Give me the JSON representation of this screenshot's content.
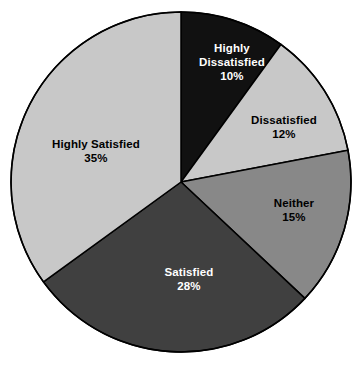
{
  "chart_data": {
    "type": "pie",
    "title": "",
    "subtitle": "",
    "xlabel": "",
    "ylabel": "",
    "grid": false,
    "legend_position": "none",
    "labels_inside_slices": true,
    "start_angle_deg": 0,
    "direction": "clockwise",
    "categories": [
      "Highly Dissatisfied",
      "Dissatisfied",
      "Neither",
      "Satisfied",
      "Highly Satisfied"
    ],
    "values": [
      10,
      12,
      15,
      28,
      35
    ],
    "value_unit": "%",
    "slices": [
      {
        "label": "Highly Dissatisfied",
        "value": 10,
        "value_text": "10%",
        "color": "#111111",
        "text_color": "#ffffff",
        "start_deg": 0,
        "end_deg": 36,
        "label_x": 232,
        "label_y": 62
      },
      {
        "label": "Dissatisfied",
        "value": 12,
        "value_text": "12%",
        "color": "#c8c8c8",
        "text_color": "#000000",
        "start_deg": 36,
        "end_deg": 79.2,
        "label_x": 284,
        "label_y": 127
      },
      {
        "label": "Neither",
        "value": 15,
        "value_text": "15%",
        "color": "#888888",
        "text_color": "#000000",
        "start_deg": 79.2,
        "end_deg": 133.2,
        "label_x": 294,
        "label_y": 210
      },
      {
        "label": "Satisfied",
        "value": 28,
        "value_text": "28%",
        "color": "#404040",
        "text_color": "#ffffff",
        "start_deg": 133.2,
        "end_deg": 234,
        "label_x": 189,
        "label_y": 279
      },
      {
        "label": "Highly Satisfied",
        "value": 35,
        "value_text": "35%",
        "color": "#c8c8c8",
        "text_color": "#000000",
        "start_deg": 234,
        "end_deg": 360,
        "label_x": 96,
        "label_y": 151
      }
    ],
    "geometry": {
      "center_x": 181,
      "center_y": 182,
      "radius": 170,
      "outline_color": "#000000",
      "outline_width": 1.5,
      "background": "#ffffff"
    }
  }
}
